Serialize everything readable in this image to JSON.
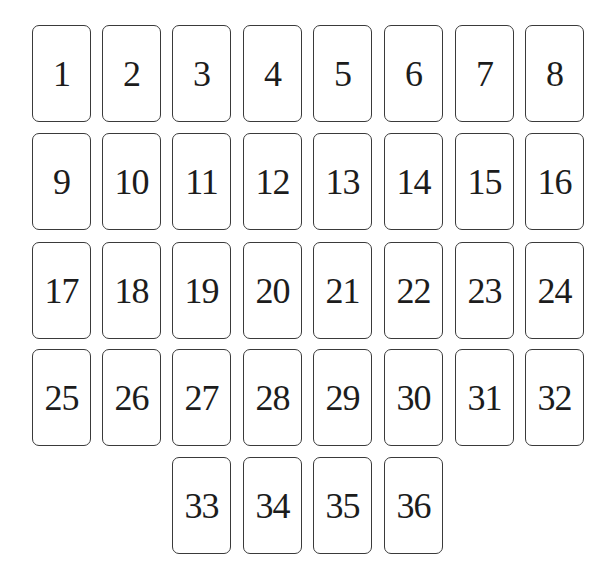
{
  "layout": {
    "columns_x": [
      32,
      102,
      172,
      243,
      313,
      384,
      455,
      525
    ],
    "rows_y": [
      25,
      133,
      242,
      349,
      457
    ],
    "card_width": 59,
    "card_height": 97
  },
  "colors": {
    "border": "#3a3a3a",
    "text": "#1c1c1c",
    "background": "#ffffff"
  },
  "cards": [
    {
      "label": "1",
      "row": 0,
      "col": 0
    },
    {
      "label": "2",
      "row": 0,
      "col": 1
    },
    {
      "label": "3",
      "row": 0,
      "col": 2
    },
    {
      "label": "4",
      "row": 0,
      "col": 3
    },
    {
      "label": "5",
      "row": 0,
      "col": 4
    },
    {
      "label": "6",
      "row": 0,
      "col": 5
    },
    {
      "label": "7",
      "row": 0,
      "col": 6
    },
    {
      "label": "8",
      "row": 0,
      "col": 7
    },
    {
      "label": "9",
      "row": 1,
      "col": 0
    },
    {
      "label": "10",
      "row": 1,
      "col": 1
    },
    {
      "label": "11",
      "row": 1,
      "col": 2
    },
    {
      "label": "12",
      "row": 1,
      "col": 3
    },
    {
      "label": "13",
      "row": 1,
      "col": 4
    },
    {
      "label": "14",
      "row": 1,
      "col": 5
    },
    {
      "label": "15",
      "row": 1,
      "col": 6
    },
    {
      "label": "16",
      "row": 1,
      "col": 7
    },
    {
      "label": "17",
      "row": 2,
      "col": 0
    },
    {
      "label": "18",
      "row": 2,
      "col": 1
    },
    {
      "label": "19",
      "row": 2,
      "col": 2
    },
    {
      "label": "20",
      "row": 2,
      "col": 3
    },
    {
      "label": "21",
      "row": 2,
      "col": 4
    },
    {
      "label": "22",
      "row": 2,
      "col": 5
    },
    {
      "label": "23",
      "row": 2,
      "col": 6
    },
    {
      "label": "24",
      "row": 2,
      "col": 7
    },
    {
      "label": "25",
      "row": 3,
      "col": 0
    },
    {
      "label": "26",
      "row": 3,
      "col": 1
    },
    {
      "label": "27",
      "row": 3,
      "col": 2
    },
    {
      "label": "28",
      "row": 3,
      "col": 3
    },
    {
      "label": "29",
      "row": 3,
      "col": 4
    },
    {
      "label": "30",
      "row": 3,
      "col": 5
    },
    {
      "label": "31",
      "row": 3,
      "col": 6
    },
    {
      "label": "32",
      "row": 3,
      "col": 7
    },
    {
      "label": "33",
      "row": 4,
      "col": 2
    },
    {
      "label": "34",
      "row": 4,
      "col": 3
    },
    {
      "label": "35",
      "row": 4,
      "col": 4
    },
    {
      "label": "36",
      "row": 4,
      "col": 5
    }
  ]
}
